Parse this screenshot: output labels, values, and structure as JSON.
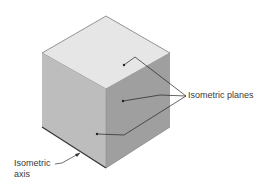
{
  "figure": {
    "labels": {
      "planes": "Isometric planes",
      "axis_line1": "Isometric",
      "axis_line2": "axis"
    },
    "colors": {
      "top_face": "#e6e6e6",
      "left_face": "#bdbdbd",
      "right_face": "#9f9f9f",
      "edge": "#555555",
      "leader": "#222222"
    }
  }
}
